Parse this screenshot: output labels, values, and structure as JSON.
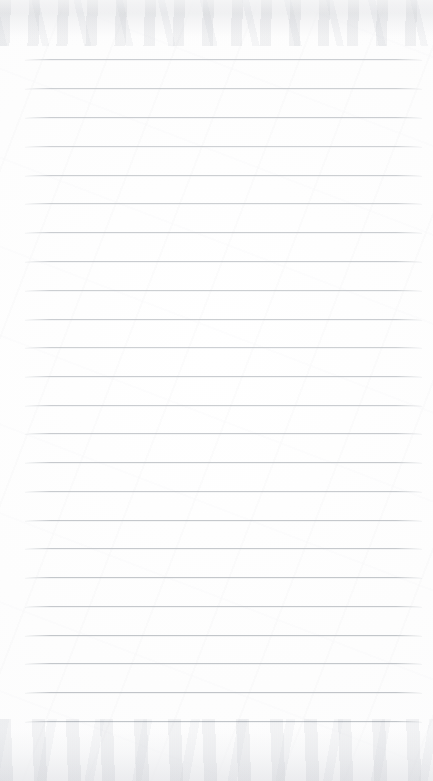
{
  "document": {
    "kind": "scanned-blank-ruled-notebook-page",
    "page_width": 433,
    "page_height": 781,
    "paper_color": "#fdfdfd",
    "has_visible_text": false,
    "has_margin_rule": false,
    "header_text": "",
    "footer_text": "",
    "body_text": ""
  },
  "ruling": {
    "line_color": "#b9bdc2",
    "line_thickness_px": 1,
    "line_count": 24,
    "first_line_y": 59,
    "line_spacing_px": 28.85,
    "line_start_x": 25,
    "line_end_x": 422,
    "lines": [
      {
        "index": 1,
        "y": 59,
        "opacity": 0.72
      },
      {
        "index": 2,
        "y": 88,
        "opacity": 0.7
      },
      {
        "index": 3,
        "y": 117,
        "opacity": 0.74
      },
      {
        "index": 4,
        "y": 146,
        "opacity": 0.68
      },
      {
        "index": 5,
        "y": 175,
        "opacity": 0.72
      },
      {
        "index": 6,
        "y": 203,
        "opacity": 0.7
      },
      {
        "index": 7,
        "y": 232,
        "opacity": 0.74
      },
      {
        "index": 8,
        "y": 261,
        "opacity": 0.76
      },
      {
        "index": 9,
        "y": 290,
        "opacity": 0.72
      },
      {
        "index": 10,
        "y": 319,
        "opacity": 0.74
      },
      {
        "index": 11,
        "y": 347,
        "opacity": 0.7
      },
      {
        "index": 12,
        "y": 376,
        "opacity": 0.76
      },
      {
        "index": 13,
        "y": 405,
        "opacity": 0.74
      },
      {
        "index": 14,
        "y": 433,
        "opacity": 0.78
      },
      {
        "index": 15,
        "y": 462,
        "opacity": 0.8
      },
      {
        "index": 16,
        "y": 491,
        "opacity": 0.78
      },
      {
        "index": 17,
        "y": 520,
        "opacity": 0.82
      },
      {
        "index": 18,
        "y": 548,
        "opacity": 0.8
      },
      {
        "index": 19,
        "y": 577,
        "opacity": 0.84
      },
      {
        "index": 20,
        "y": 606,
        "opacity": 0.82
      },
      {
        "index": 21,
        "y": 635,
        "opacity": 0.86
      },
      {
        "index": 22,
        "y": 663,
        "opacity": 0.84
      },
      {
        "index": 23,
        "y": 692,
        "opacity": 0.88
      },
      {
        "index": 24,
        "y": 721,
        "opacity": 0.9
      }
    ]
  },
  "scan_artifacts": {
    "top_edge_shading": true,
    "bottom_edge_shading": true,
    "shade_color": "#e7e8eb"
  }
}
